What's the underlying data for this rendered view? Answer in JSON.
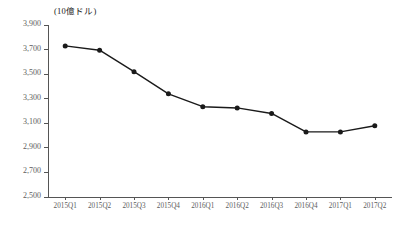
{
  "chart_data": {
    "type": "line",
    "title": "",
    "subtitle": "",
    "unit_label": "(10億ドル)",
    "xlabel": "",
    "ylabel": "",
    "categories": [
      "2015Q1",
      "2015Q2",
      "2015Q3",
      "2015Q4",
      "2016Q1",
      "2016Q2",
      "2016Q3",
      "2016Q4",
      "2017Q1",
      "2017Q2"
    ],
    "values": [
      3730,
      3695,
      3520,
      3340,
      3235,
      3225,
      3180,
      3030,
      3030,
      3080
    ],
    "ylim": [
      2500,
      3900
    ],
    "ytick_labels": [
      "3,900",
      "3,700",
      "3,500",
      "3,300",
      "3,100",
      "2,900",
      "2,700",
      "2,500"
    ],
    "ytick_values": [
      3900,
      3700,
      3500,
      3300,
      3100,
      2900,
      2700,
      2500
    ],
    "grid": false,
    "legend": null,
    "series": [
      {
        "name": "",
        "values": [
          3730,
          3695,
          3520,
          3340,
          3235,
          3225,
          3180,
          3030,
          3030,
          3080
        ],
        "line_color": "#1a1a1a",
        "marker_color": "#1a1a1a",
        "marker": "circle"
      }
    ],
    "annotations": []
  },
  "style": {
    "axis_color": "#555555",
    "tick_text_color": "#5d5d5d",
    "series_color": "#1a1a1a",
    "background": "#ffffff"
  }
}
